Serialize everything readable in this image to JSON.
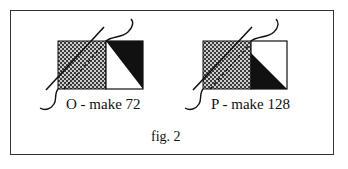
{
  "figure": {
    "label": "fig. 2",
    "panels": [
      {
        "id": "O",
        "caption": "O - make 72",
        "left_square": "checkered",
        "right_square": "white with black upper-right triangle"
      },
      {
        "id": "P",
        "caption": "P - make 128",
        "left_square": "checkered",
        "right_square": "white with black lower-left triangle"
      }
    ]
  },
  "colors": {
    "border": "#333333",
    "fill_black": "#111111",
    "background": "#ffffff"
  }
}
